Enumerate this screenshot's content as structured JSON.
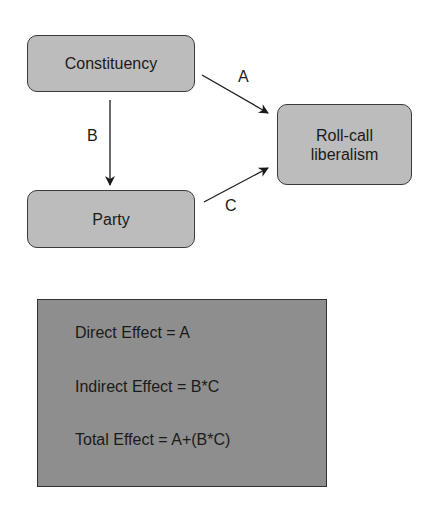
{
  "diagram": {
    "nodes": {
      "constituency": "Constituency",
      "party": "Party",
      "rollcall_line1": "Roll-call",
      "rollcall_line2": "liberalism"
    },
    "edges": [
      {
        "label": "A",
        "from": "Constituency",
        "to": "Roll-call liberalism"
      },
      {
        "label": "B",
        "from": "Constituency",
        "to": "Party"
      },
      {
        "label": "C",
        "from": "Party",
        "to": "Roll-call liberalism"
      }
    ],
    "colors": {
      "node_fill": "#bcbcbc",
      "effects_fill": "#8e8e8e",
      "stroke": "#1a1a1a"
    }
  },
  "effects": {
    "direct": "Direct Effect = A",
    "indirect": "Indirect Effect = B*C",
    "total": "Total Effect = A+(B*C)"
  }
}
